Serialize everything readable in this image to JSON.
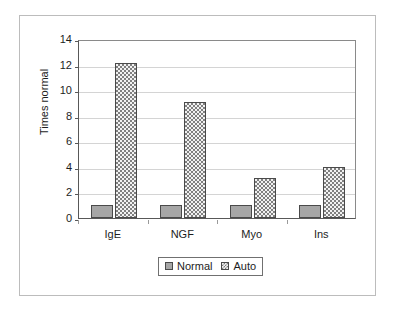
{
  "chart_data": {
    "type": "bar",
    "title": "",
    "xlabel": "",
    "ylabel": "Times normal",
    "categories": [
      "IgE",
      "NGF",
      "Myo",
      "Ins"
    ],
    "series": [
      {
        "name": "Normal",
        "values": [
          1.0,
          1.0,
          1.0,
          1.0
        ],
        "color": "#a6a6a6",
        "pattern": "solid-gray"
      },
      {
        "name": "Auto",
        "values": [
          12.1,
          9.1,
          3.1,
          4.0
        ],
        "color": "#808080",
        "pattern": "checkered"
      }
    ],
    "ylim": [
      0,
      14
    ],
    "yticks": [
      0,
      2,
      4,
      6,
      8,
      10,
      12,
      14
    ],
    "ytick_labels": [
      "0",
      "2",
      "4",
      "6",
      "8",
      "10",
      "12",
      "14"
    ],
    "grid": true,
    "grid_axis": "y",
    "legend": {
      "position": "bottom-center",
      "entries": [
        {
          "label": "Normal",
          "swatch": "normal-swatch"
        },
        {
          "label": "Auto",
          "swatch": "auto-swatch"
        }
      ]
    }
  }
}
